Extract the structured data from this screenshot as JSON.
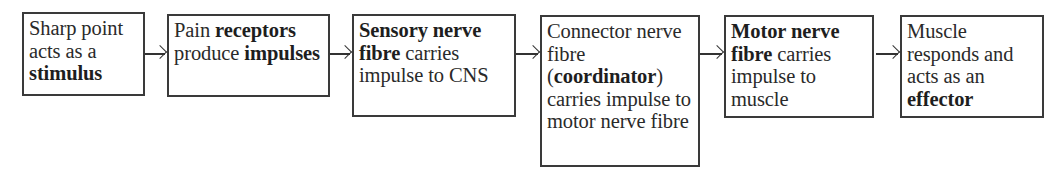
{
  "diagram": {
    "boxes": [
      {
        "segments": [
          {
            "text": "Sharp point acts as a ",
            "bold": false
          },
          {
            "text": "stimulus",
            "bold": true
          }
        ]
      },
      {
        "segments": [
          {
            "text": "Pain ",
            "bold": false
          },
          {
            "text": "receptors",
            "bold": true
          },
          {
            "text": " produce ",
            "bold": false
          },
          {
            "text": "impulses",
            "bold": true
          }
        ]
      },
      {
        "segments": [
          {
            "text": "Sensory nerve fibre",
            "bold": true
          },
          {
            "text": " carries impulse to CNS",
            "bold": false
          }
        ]
      },
      {
        "segments": [
          {
            "text": "Connector nerve fibre (",
            "bold": false
          },
          {
            "text": "coordinator",
            "bold": true
          },
          {
            "text": ") carries impulse to motor nerve fibre",
            "bold": false
          }
        ]
      },
      {
        "segments": [
          {
            "text": "Motor nerve fibre",
            "bold": true
          },
          {
            "text": " carries impulse to muscle",
            "bold": false
          }
        ]
      },
      {
        "segments": [
          {
            "text": "Muscle responds and acts as an ",
            "bold": false
          },
          {
            "text": "effector",
            "bold": true
          }
        ]
      }
    ],
    "arrows": [
      "right-arrow",
      "right-arrow",
      "right-arrow",
      "right-arrow",
      "right-arrow"
    ]
  }
}
